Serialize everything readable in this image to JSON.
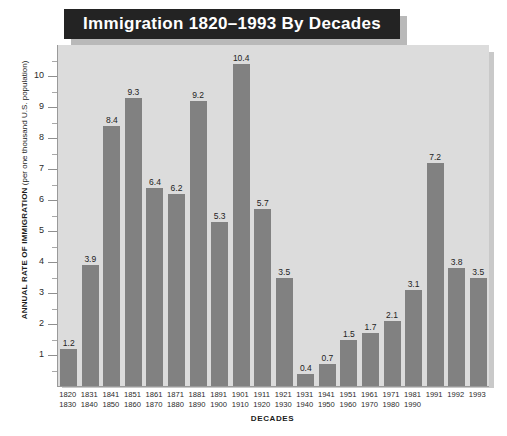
{
  "chart_data": {
    "type": "bar",
    "title": "Immigration 1820–1993 By Decades",
    "xlabel": "DECADES",
    "ylabel": "ANNUAL RATE OF IMMIGRATION (per one thousand U.S. population)",
    "ylabel_bold_part": "ANNUAL RATE OF IMMIGRATION",
    "ylabel_normal_part": " (per one thousand U.S. population)",
    "ylim": [
      0,
      11
    ],
    "yticks": [
      1,
      2,
      3,
      4,
      5,
      6,
      7,
      8,
      9,
      10
    ],
    "grid": false,
    "legend": "none",
    "bar_color": "#818181",
    "plot_background": "#dcdcdc",
    "title_background": "#232323",
    "title_color": "#ffffff",
    "categories": [
      "1820\n1830",
      "1831\n1840",
      "1841\n1850",
      "1851\n1860",
      "1861\n1870",
      "1871\n1880",
      "1881\n1890",
      "1891\n1900",
      "1901\n1910",
      "1911\n1920",
      "1921\n1930",
      "1931\n1940",
      "1941\n1950",
      "1951\n1960",
      "1961\n1970",
      "1971\n1980",
      "1981\n1990",
      "1991",
      "1992",
      "1993"
    ],
    "category_lines": [
      [
        "1820",
        "1830"
      ],
      [
        "1831",
        "1840"
      ],
      [
        "1841",
        "1850"
      ],
      [
        "1851",
        "1860"
      ],
      [
        "1861",
        "1870"
      ],
      [
        "1871",
        "1880"
      ],
      [
        "1881",
        "1890"
      ],
      [
        "1891",
        "1900"
      ],
      [
        "1901",
        "1910"
      ],
      [
        "1911",
        "1920"
      ],
      [
        "1921",
        "1930"
      ],
      [
        "1931",
        "1940"
      ],
      [
        "1941",
        "1950"
      ],
      [
        "1951",
        "1960"
      ],
      [
        "1961",
        "1970"
      ],
      [
        "1971",
        "1980"
      ],
      [
        "1981",
        "1990"
      ],
      [
        "1991",
        ""
      ],
      [
        "1992",
        ""
      ],
      [
        "1993",
        ""
      ]
    ],
    "values": [
      1.2,
      3.9,
      8.4,
      9.3,
      6.4,
      6.2,
      9.2,
      5.3,
      10.4,
      5.7,
      3.5,
      0.4,
      0.7,
      1.5,
      1.7,
      2.1,
      3.1,
      7.2,
      3.8,
      3.5
    ],
    "value_labels": [
      "1.2",
      "3.9",
      "8.4",
      "9.3",
      "6.4",
      "6.2",
      "9.2",
      "5.3",
      "10.4",
      "5.7",
      "3.5",
      "0.4",
      "0.7",
      "1.5",
      "1.7",
      "2.1",
      "3.1",
      "7.2",
      "3.8",
      "3.5"
    ]
  }
}
